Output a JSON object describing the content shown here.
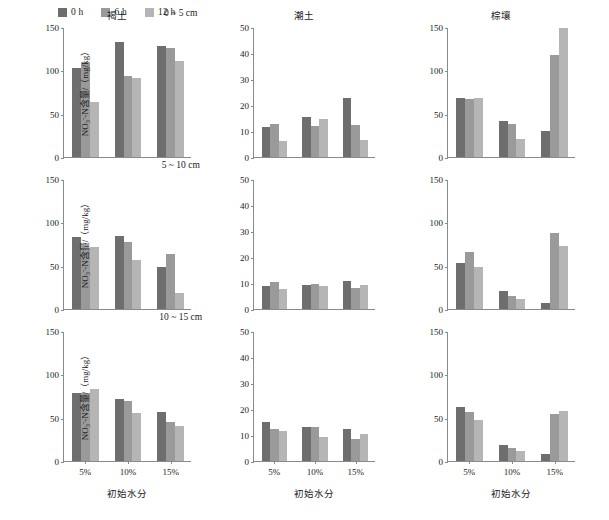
{
  "legend": {
    "items": [
      {
        "label": "0 h",
        "color": "#6e6e6e"
      },
      {
        "label": "6 h",
        "color": "#9a9a9a"
      },
      {
        "label": "12 h",
        "color": "#b5b5b5"
      }
    ]
  },
  "axis": {
    "ylabel_main": "NO",
    "ylabel_sub": "3",
    "ylabel_sup": "-",
    "ylabel_rest": "-N含量/（mg/kg）",
    "xlabel": "初始水分"
  },
  "columns": [
    {
      "name": "褐土",
      "ymax": 150,
      "yticks": [
        0,
        50,
        100,
        150
      ]
    },
    {
      "name": "潮土",
      "ymax": 50,
      "yticks": [
        0,
        10,
        20,
        30,
        40,
        50
      ]
    },
    {
      "name": "棕壤",
      "ymax": 150,
      "yticks": [
        0,
        50,
        100,
        150
      ]
    }
  ],
  "rows": [
    {
      "depth": "0 ~ 5 cm"
    },
    {
      "depth": "5 ~ 10 cm"
    },
    {
      "depth": "10 ~ 15 cm"
    }
  ],
  "categories": [
    "5%",
    "10%",
    "15%"
  ],
  "chart_data": {
    "type": "bar",
    "title": "",
    "xlabel": "初始水分",
    "ylabel": "NO3--N含量/（mg/kg）",
    "categories": [
      "5%",
      "10%",
      "15%"
    ],
    "series_names": [
      "0 h",
      "6 h",
      "12 h"
    ],
    "grid": false,
    "legend_position": "top-left",
    "panels": [
      {
        "soil": "褐土",
        "depth": "0 ~ 5 cm",
        "ylim": [
          0,
          150
        ],
        "series": [
          {
            "name": "0 h",
            "values": [
              103,
              133,
              128
            ]
          },
          {
            "name": "6 h",
            "values": [
              110,
              94,
              126
            ]
          },
          {
            "name": "12 h",
            "values": [
              64,
              91,
              111
            ]
          }
        ]
      },
      {
        "soil": "潮土",
        "depth": "0 ~ 5 cm",
        "ylim": [
          0,
          50
        ],
        "series": [
          {
            "name": "0 h",
            "values": [
              11.5,
              15.2,
              22.8
            ]
          },
          {
            "name": "6 h",
            "values": [
              12.6,
              11.8,
              12.4
            ]
          },
          {
            "name": "12 h",
            "values": [
              6.1,
              14.5,
              6.7
            ]
          }
        ]
      },
      {
        "soil": "棕壤",
        "depth": "0 ~ 5 cm",
        "ylim": [
          0,
          150
        ],
        "series": [
          {
            "name": "0 h",
            "values": [
              68,
              41,
              30
            ]
          },
          {
            "name": "6 h",
            "values": [
              67,
              38,
              118
            ]
          },
          {
            "name": "12 h",
            "values": [
              68,
              21,
              149
            ]
          }
        ]
      },
      {
        "soil": "褐土",
        "depth": "5 ~ 10 cm",
        "ylim": [
          0,
          150
        ],
        "series": [
          {
            "name": "0 h",
            "values": [
              83,
              84,
              49
            ]
          },
          {
            "name": "6 h",
            "values": [
              70,
              77,
              63
            ]
          },
          {
            "name": "12 h",
            "values": [
              71,
              56,
              19
            ]
          }
        ]
      },
      {
        "soil": "潮土",
        "depth": "5 ~ 10 cm",
        "ylim": [
          0,
          50
        ],
        "series": [
          {
            "name": "0 h",
            "values": [
              8.7,
              9.3,
              10.7
            ]
          },
          {
            "name": "6 h",
            "values": [
              10.2,
              9.7,
              8.1
            ]
          },
          {
            "name": "12 h",
            "values": [
              7.7,
              8.8,
              9.2
            ]
          }
        ]
      },
      {
        "soil": "棕壤",
        "depth": "5 ~ 10 cm",
        "ylim": [
          0,
          150
        ],
        "series": [
          {
            "name": "0 h",
            "values": [
              53,
              21,
              7
            ]
          },
          {
            "name": "6 h",
            "values": [
              66,
              15,
              88
            ]
          },
          {
            "name": "12 h",
            "values": [
              48,
              11,
              73
            ]
          }
        ]
      },
      {
        "soil": "褐土",
        "depth": "10 ~ 15 cm",
        "ylim": [
          0,
          150
        ],
        "series": [
          {
            "name": "0 h",
            "values": [
              78,
              72,
              56
            ]
          },
          {
            "name": "6 h",
            "values": [
              78,
              69,
              45
            ]
          },
          {
            "name": "12 h",
            "values": [
              83,
              55,
              40
            ]
          }
        ]
      },
      {
        "soil": "潮土",
        "depth": "10 ~ 15 cm",
        "ylim": [
          0,
          50
        ],
        "series": [
          {
            "name": "0 h",
            "values": [
              15.0,
              13.0,
              12.5
            ]
          },
          {
            "name": "6 h",
            "values": [
              12.2,
              13.1,
              8.4
            ]
          },
          {
            "name": "12 h",
            "values": [
              11.7,
              9.2,
              10.2
            ]
          }
        ]
      },
      {
        "soil": "棕壤",
        "depth": "10 ~ 15 cm",
        "ylim": [
          0,
          150
        ],
        "series": [
          {
            "name": "0 h",
            "values": [
              62,
              18,
              8
            ]
          },
          {
            "name": "6 h",
            "values": [
              57,
              15,
              54
            ]
          },
          {
            "name": "12 h",
            "values": [
              47,
              11,
              58
            ]
          }
        ]
      }
    ]
  }
}
